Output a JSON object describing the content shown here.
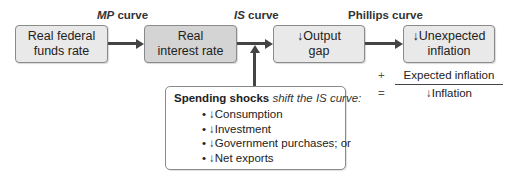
{
  "curve_labels": {
    "mp": {
      "italic": "MP",
      "rest": " curve"
    },
    "is": {
      "italic": "IS",
      "rest": " curve"
    },
    "phillips": "Phillips curve"
  },
  "boxes": [
    {
      "id": "real-federal-funds-rate",
      "line1": "Real federal",
      "line2": "funds rate",
      "shade": "light"
    },
    {
      "id": "real-interest-rate",
      "line1": "Real",
      "line2": "interest rate",
      "shade": "dark"
    },
    {
      "id": "output-gap",
      "line1": "↓Output",
      "line2": "gap",
      "shade": "light"
    },
    {
      "id": "unexpected-inflation",
      "line1": "↓Unexpected",
      "line2": "inflation",
      "shade": "light"
    }
  ],
  "equation": {
    "plus_sign": "+",
    "plus_term": "Expected inflation",
    "equals_sign": "=",
    "result": "↓Inflation"
  },
  "shocks": {
    "title_bold": "Spending shocks",
    "title_italic": " shift the IS curve:",
    "bullet": "•",
    "items": [
      "↓Consumption",
      "↓Investment",
      "↓Government purchases; or",
      "↓Net exports"
    ]
  },
  "colors": {
    "box_light": "#e9e9e9",
    "box_dark": "#d4d4d4",
    "arrow": "#444444",
    "border": "#8a8a8a"
  }
}
